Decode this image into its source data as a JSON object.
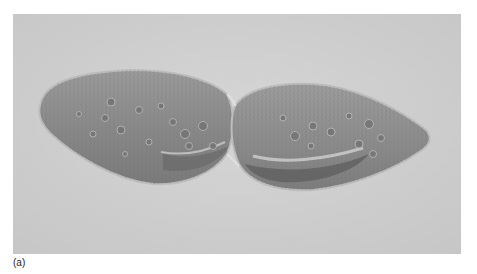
{
  "figure": {
    "caption": "(a)",
    "background_color": "#cfcfcf",
    "cell_color": "#8a8a8a",
    "cell_edge_color": "#b9b9b9"
  }
}
